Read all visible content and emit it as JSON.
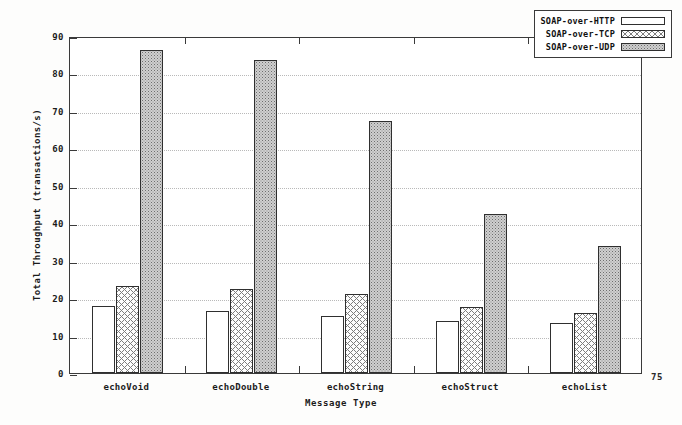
{
  "page": {
    "number": "75"
  },
  "chart_data": {
    "type": "bar",
    "title": "",
    "xlabel": "Message Type",
    "ylabel": "Total Throughput (transactions/s)",
    "categories": [
      "echoVoid",
      "echoDouble",
      "echoString",
      "echoStruct",
      "echoList"
    ],
    "series": [
      {
        "name": "SOAP-over-HTTP",
        "values": [
          17.8,
          16.5,
          15.2,
          13.8,
          13.3
        ]
      },
      {
        "name": "SOAP-over-TCP",
        "values": [
          23.3,
          22.5,
          21.2,
          17.6,
          16.0
        ]
      },
      {
        "name": "SOAP-over-UDP",
        "values": [
          86.2,
          83.6,
          67.3,
          42.5,
          34.0
        ]
      }
    ],
    "ylim": [
      0,
      90
    ],
    "yticks": [
      "0",
      "10",
      "20",
      "30",
      "40",
      "50",
      "60",
      "70",
      "80",
      "90"
    ],
    "grid": true,
    "legend_position": "top-right"
  },
  "legend": {
    "items": [
      {
        "label": "SOAP-over-HTTP",
        "pattern": "empty"
      },
      {
        "label": "SOAP-over-TCP",
        "pattern": "cross-hatch"
      },
      {
        "label": "SOAP-over-UDP",
        "pattern": "stipple"
      }
    ]
  }
}
